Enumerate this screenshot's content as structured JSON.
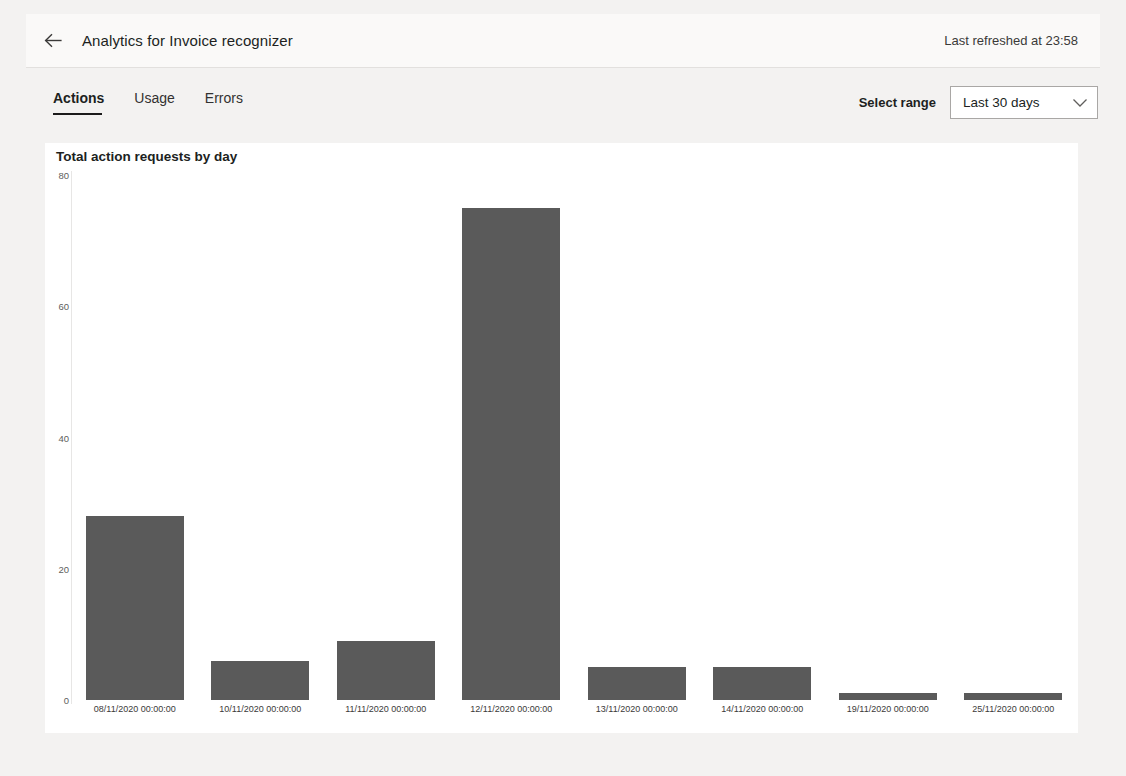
{
  "header": {
    "back_icon": "arrow-left-icon",
    "title": "Analytics for Invoice recognizer",
    "refreshed": "Last refreshed at 23:58"
  },
  "tabs": [
    {
      "label": "Actions",
      "active": true
    },
    {
      "label": "Usage",
      "active": false
    },
    {
      "label": "Errors",
      "active": false
    }
  ],
  "range": {
    "label": "Select range",
    "value": "Last 30 days",
    "chevron_icon": "chevron-down-icon",
    "options": [
      "Last 30 days"
    ]
  },
  "colors": {
    "bar": "#5a5a5a",
    "panel": "#ffffff",
    "chrome": "#f3f2f1",
    "header": "#faf9f8",
    "tab_underline": "#1b1b1b"
  },
  "chart_data": {
    "type": "bar",
    "title": "Total action requests by day",
    "xlabel": "",
    "ylabel": "",
    "ylim": [
      0,
      80
    ],
    "yticks": [
      0,
      20,
      40,
      60,
      80
    ],
    "grid": false,
    "legend": "none",
    "categories": [
      "08/11/2020 00:00:00",
      "10/11/2020 00:00:00",
      "11/11/2020 00:00:00",
      "12/11/2020 00:00:00",
      "13/11/2020 00:00:00",
      "14/11/2020 00:00:00",
      "19/11/2020 00:00:00",
      "25/11/2020 00:00:00"
    ],
    "values": [
      28,
      6,
      9,
      75,
      5,
      5,
      1,
      1
    ]
  }
}
